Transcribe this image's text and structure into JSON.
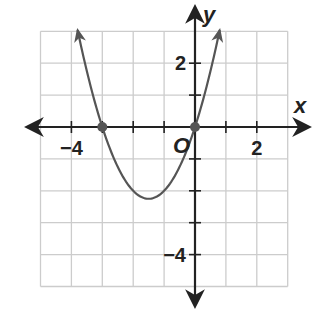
{
  "chart_data": {
    "type": "line",
    "title": "",
    "xlabel": "x",
    "ylabel": "y",
    "origin_label": "O",
    "xlim": [
      -5,
      3
    ],
    "ylim": [
      -5,
      3
    ],
    "grid": true,
    "x_tick_labels": [
      {
        "value": -4,
        "label": "−4"
      },
      {
        "value": 2,
        "label": "2"
      }
    ],
    "y_tick_labels": [
      {
        "value": 2,
        "label": "2"
      },
      {
        "value": -4,
        "label": "−4"
      }
    ],
    "series": [
      {
        "name": "parabola",
        "equation": "y = x^2 + 3x",
        "vertex": [
          -1.5,
          -2.25
        ],
        "x": [
          -3.8,
          -3.5,
          -3,
          -2.5,
          -2,
          -1.5,
          -1,
          -0.5,
          0,
          0.5,
          0.8
        ],
        "y": [
          3.04,
          1.75,
          0,
          -1.25,
          -2,
          -2.25,
          -2,
          -1.25,
          0,
          1.75,
          3.04
        ],
        "arrows_at_ends": true
      }
    ],
    "points": [
      {
        "x": -3,
        "y": 0,
        "label": "x-intercept"
      },
      {
        "x": 0,
        "y": 0,
        "label": "x-intercept"
      }
    ]
  },
  "colors": {
    "grid": "#cccccc",
    "axis": "#222222",
    "curve": "#555555",
    "points": "#555555"
  }
}
